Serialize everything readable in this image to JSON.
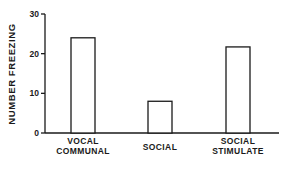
{
  "chart_data": {
    "type": "bar",
    "title": "",
    "xlabel": "",
    "ylabel": "NUMBER FREEZING",
    "ylim": [
      0,
      30
    ],
    "yticks": [
      0,
      10,
      20,
      30
    ],
    "grid": false,
    "legend": null,
    "categories": [
      "VOCAL COMMUNAL",
      "SOCIAL",
      "SOCIAL STIMULATE"
    ],
    "category_lines": [
      [
        "VOCAL",
        "COMMUNAL"
      ],
      [
        "SOCIAL"
      ],
      [
        "SOCIAL",
        "STIMULATE"
      ]
    ],
    "values": [
      24,
      8,
      21.7
    ],
    "bar_fill": "#ffffff",
    "bar_stroke": "#1a1a1a"
  }
}
